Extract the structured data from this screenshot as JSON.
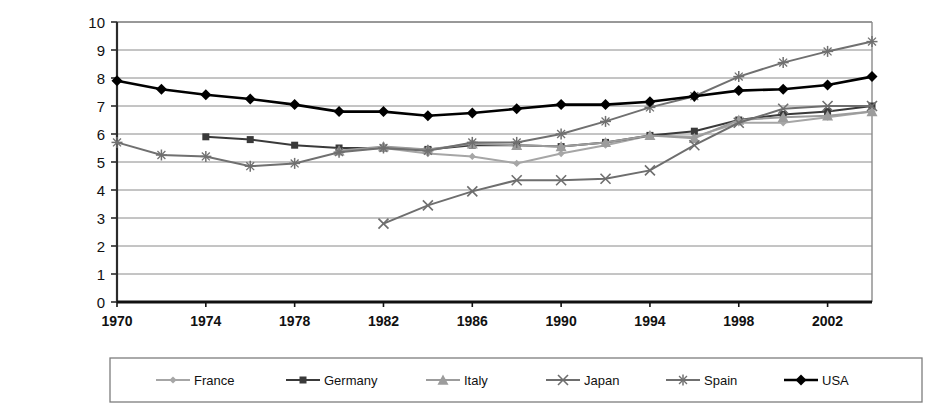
{
  "chart_data": {
    "type": "line",
    "title": "",
    "xlabel": "",
    "ylabel": "LBW -- % of live births",
    "ylim": [
      0,
      10
    ],
    "xlim": [
      1970,
      2004
    ],
    "ytick_labels": [
      "0",
      "1",
      "2",
      "3",
      "4",
      "5",
      "6",
      "7",
      "8",
      "9",
      "10"
    ],
    "ytick_values": [
      0,
      1,
      2,
      3,
      4,
      5,
      6,
      7,
      8,
      9,
      10
    ],
    "xtick_labels": [
      "1970",
      "1974",
      "1978",
      "1982",
      "1986",
      "1990",
      "1994",
      "1998",
      "2002"
    ],
    "xtick_values": [
      1970,
      1974,
      1978,
      1982,
      1986,
      1990,
      1994,
      1998,
      2002
    ],
    "grid": true,
    "legend_position": "bottom",
    "x": [
      1970,
      1972,
      1974,
      1976,
      1978,
      1980,
      1982,
      1984,
      1986,
      1988,
      1990,
      1992,
      1994,
      1996,
      1998,
      2000,
      2002,
      2004
    ],
    "series": [
      {
        "name": "France",
        "color": "#a6a6a6",
        "marker": "diamond",
        "x": [
          1980,
          1982,
          1984,
          1986,
          1988,
          1990,
          1992,
          1994,
          1996,
          1998,
          2000,
          2002,
          2004
        ],
        "values": [
          5.4,
          5.5,
          5.3,
          5.2,
          4.95,
          5.3,
          5.6,
          5.95,
          5.9,
          6.4,
          6.4,
          6.6,
          6.8
        ]
      },
      {
        "name": "Germany",
        "color": "#3a3a3a",
        "marker": "square",
        "x": [
          1974,
          1976,
          1978,
          1980,
          1982,
          1984,
          1986,
          1988,
          1990,
          1992,
          1994,
          1996,
          1998,
          2000,
          2002,
          2004
        ],
        "values": [
          5.9,
          5.8,
          5.6,
          5.5,
          5.5,
          5.45,
          5.6,
          5.6,
          5.55,
          5.7,
          5.95,
          6.1,
          6.5,
          6.7,
          6.8,
          7.0
        ]
      },
      {
        "name": "Italy",
        "color": "#9c9c9c",
        "marker": "triangle",
        "x": [
          1980,
          1982,
          1984,
          1986,
          1988,
          1990,
          1992,
          1994,
          1996,
          1998,
          2000,
          2002,
          2004
        ],
        "values": [
          5.4,
          5.55,
          5.45,
          5.65,
          5.6,
          5.55,
          5.7,
          5.95,
          5.85,
          6.5,
          6.6,
          6.65,
          6.8
        ]
      },
      {
        "name": "Japan",
        "color": "#6e6e6e",
        "marker": "cross",
        "x": [
          1982,
          1984,
          1986,
          1988,
          1990,
          1992,
          1994,
          1996,
          1998,
          2000,
          2002,
          2004
        ],
        "values": [
          2.8,
          3.45,
          3.95,
          4.35,
          4.35,
          4.4,
          4.7,
          5.6,
          6.4,
          6.9,
          7.0,
          7.0
        ]
      },
      {
        "name": "Spain",
        "color": "#707070",
        "marker": "star",
        "x": [
          1970,
          1972,
          1974,
          1976,
          1978,
          1980,
          1982,
          1984,
          1986,
          1988,
          1990,
          1992,
          1994,
          1996,
          1998,
          2000,
          2002,
          2004
        ],
        "values": [
          5.7,
          5.25,
          5.2,
          4.85,
          4.95,
          5.35,
          5.5,
          5.4,
          5.7,
          5.7,
          6.0,
          6.45,
          6.95,
          7.35,
          8.05,
          8.55,
          8.95,
          9.3
        ]
      },
      {
        "name": "USA",
        "color": "#000000",
        "marker": "filled-diamond",
        "x": [
          1970,
          1972,
          1974,
          1976,
          1978,
          1980,
          1982,
          1984,
          1986,
          1988,
          1990,
          1992,
          1994,
          1996,
          1998,
          2000,
          2002,
          2004
        ],
        "values": [
          7.9,
          7.6,
          7.4,
          7.25,
          7.05,
          6.8,
          6.8,
          6.65,
          6.75,
          6.9,
          7.05,
          7.05,
          7.15,
          7.35,
          7.55,
          7.6,
          7.75,
          8.05
        ]
      }
    ]
  },
  "legend": {
    "items": [
      {
        "label": "France"
      },
      {
        "label": "Germany"
      },
      {
        "label": "Italy"
      },
      {
        "label": "Japan"
      },
      {
        "label": "Spain"
      },
      {
        "label": "USA"
      }
    ]
  }
}
